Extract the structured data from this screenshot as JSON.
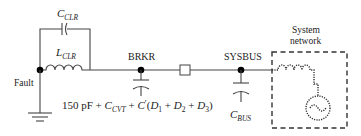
{
  "diagram": {
    "labels": {
      "c_clr_main": "C",
      "c_clr_sub": "CLR",
      "l_clr_main": "L",
      "l_clr_sub": "CLR",
      "fault": "Fault",
      "brkr": "BRKR",
      "sysbus": "SYSBUS",
      "system_network_line1": "System",
      "system_network_line2": "network",
      "c_bus_main": "C",
      "c_bus_sub": "BUS",
      "formula_150pf": "150 pF + ",
      "formula_c": "C",
      "formula_cvt_sub": "CVT",
      "formula_plus": " + ",
      "formula_cprime": "C",
      "formula_prime": "′",
      "formula_open": "(",
      "formula_d1": "D",
      "formula_d1_sub": "1",
      "formula_plus2": " + ",
      "formula_d2": "D",
      "formula_d2_sub": "2",
      "formula_plus3": " + ",
      "formula_d3": "D",
      "formula_d3_sub": "3",
      "formula_close": ")"
    },
    "colors": {
      "wire": "#444444",
      "node": "#000000",
      "text": "#222222",
      "background": "#ffffff"
    }
  }
}
